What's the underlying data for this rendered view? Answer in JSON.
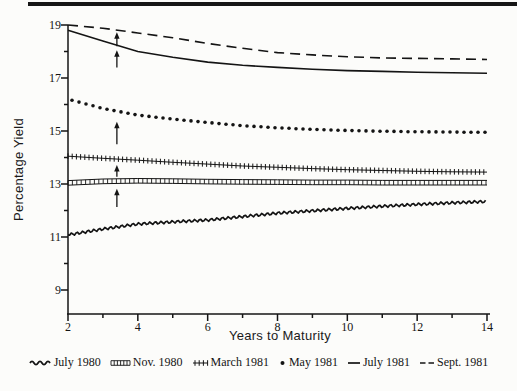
{
  "chart_data": {
    "type": "line",
    "title": "",
    "xlabel": "Years to Maturity",
    "ylabel": "Percentage Yield",
    "xlim": [
      2,
      14
    ],
    "ylim": [
      9,
      19
    ],
    "grid": false,
    "legend_position": "bottom",
    "x_ticks": [
      2,
      4,
      6,
      8,
      10,
      12,
      14
    ],
    "x_minor_ticks": [
      3,
      5,
      7,
      9,
      11,
      13
    ],
    "y_ticks": [
      19,
      17,
      15,
      13,
      11,
      9
    ],
    "y_minor_ticks": [
      18,
      16,
      14,
      12,
      10
    ],
    "x": [
      2,
      3,
      4,
      5,
      6,
      7,
      8,
      9,
      10,
      11,
      12,
      13,
      14
    ],
    "series": [
      {
        "name": "July 1980",
        "style": "wavy",
        "values": [
          11.08,
          11.3,
          11.49,
          11.57,
          11.64,
          11.77,
          11.9,
          11.99,
          12.08,
          12.16,
          12.23,
          12.29,
          12.34
        ]
      },
      {
        "name": "Nov. 1980",
        "style": "squares",
        "values": [
          13.04,
          13.1,
          13.12,
          13.11,
          13.09,
          13.08,
          13.07,
          13.06,
          13.06,
          13.05,
          13.05,
          13.05,
          13.05
        ]
      },
      {
        "name": "March 1981",
        "style": "plus",
        "values": [
          14.05,
          13.97,
          13.9,
          13.82,
          13.75,
          13.68,
          13.63,
          13.58,
          13.54,
          13.51,
          13.48,
          13.46,
          13.45
        ]
      },
      {
        "name": "May 1981",
        "style": "dots",
        "values": [
          16.2,
          15.85,
          15.6,
          15.45,
          15.32,
          15.2,
          15.12,
          15.06,
          15.02,
          14.99,
          14.97,
          14.96,
          14.95
        ]
      },
      {
        "name": "July 1981",
        "style": "solid",
        "values": [
          18.8,
          18.4,
          18.0,
          17.78,
          17.6,
          17.48,
          17.4,
          17.33,
          17.28,
          17.25,
          17.22,
          17.2,
          17.18
        ]
      },
      {
        "name": "Sept. 1981",
        "style": "dashed",
        "values": [
          19.0,
          18.88,
          18.7,
          18.52,
          18.3,
          18.12,
          17.96,
          17.87,
          17.8,
          17.76,
          17.74,
          17.72,
          17.7
        ]
      }
    ],
    "arrows": [
      {
        "x": 3.4,
        "tip": 18.73,
        "tail": 18.2,
        "points_at": "Sept. 1981"
      },
      {
        "x": 3.4,
        "tip": 18.05,
        "tail": 17.4,
        "points_at": "July 1981"
      },
      {
        "x": 3.4,
        "tip": 15.35,
        "tail": 14.5,
        "points_at": "May 1981"
      },
      {
        "x": 3.4,
        "tip": 13.72,
        "tail": 13.27,
        "points_at": "March 1981"
      },
      {
        "x": 3.4,
        "tip": 12.82,
        "tail": 12.13,
        "points_at": "Nov. 1980"
      }
    ],
    "line_color": "#141414"
  }
}
